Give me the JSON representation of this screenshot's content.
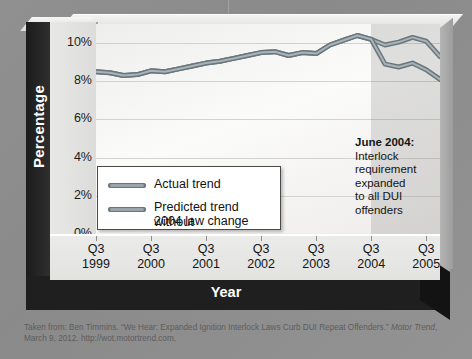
{
  "axes": {
    "y_title": "Percentage",
    "x_title": "Year",
    "y_ticks": [
      "10%",
      "8%",
      "6%",
      "4%",
      "2%",
      "0%"
    ],
    "x_ticks": [
      {
        "q": "Q3",
        "y": "1999"
      },
      {
        "q": "Q3",
        "y": "2000"
      },
      {
        "q": "Q3",
        "y": "2001"
      },
      {
        "q": "Q3",
        "y": "2002"
      },
      {
        "q": "Q3",
        "y": "2003"
      },
      {
        "q": "Q3",
        "y": "2004"
      },
      {
        "q": "Q3",
        "y": "2005"
      }
    ]
  },
  "legend": {
    "items": [
      {
        "label": "Actual trend",
        "color": "#7f8b92"
      },
      {
        "label": "Predicted trend without",
        "label2": "2004 law change",
        "color": "#7f8b92"
      }
    ]
  },
  "annotation": {
    "heading": "June 2004:",
    "line1": "Interlock",
    "line2": "requirement",
    "line3": "expanded",
    "line4": "to all DUI",
    "line5": "offenders"
  },
  "caption": {
    "line1_a": "Taken from: Ben Timmins. “We Hear: Expanded Ignition Interlock Laws Curb DUI Repeat Offenders.” ",
    "line1_italic": "Motor Trend",
    "line1_b": ",",
    "line2": "March 9, 2012. http://wot.motortrend.com."
  },
  "colors": {
    "line": "#838f95",
    "line_dark": "#6a767d",
    "plot_bg": "#f7f7f5",
    "shade": "#6e6e6e",
    "axis_bar": "#1f1f1f"
  },
  "chart_data": {
    "type": "line",
    "title": "",
    "xlabel": "Year",
    "ylabel": "Percentage",
    "ylim": [
      0,
      11
    ],
    "grid": true,
    "legend_position": "inside-lower-left",
    "x_tick_labels": [
      "Q3 1999",
      "Q3 2000",
      "Q3 2001",
      "Q3 2002",
      "Q3 2003",
      "Q3 2004",
      "Q3 2005"
    ],
    "x": [
      "Q3 1999",
      "Q4 1999",
      "Q1 2000",
      "Q2 2000",
      "Q3 2000",
      "Q4 2000",
      "Q1 2001",
      "Q2 2001",
      "Q3 2001",
      "Q4 2001",
      "Q1 2002",
      "Q2 2002",
      "Q3 2002",
      "Q4 2002",
      "Q1 2003",
      "Q2 2003",
      "Q3 2003",
      "Q4 2003",
      "Q1 2004",
      "Q2 2004",
      "Q3 2004",
      "Q4 2004",
      "Q1 2005",
      "Q2 2005",
      "Q3 2005",
      "Q4 2005"
    ],
    "series": [
      {
        "name": "Actual trend",
        "color": "#838f95",
        "values": [
          8.5,
          8.45,
          8.3,
          8.35,
          8.55,
          8.5,
          8.65,
          8.8,
          8.95,
          9.05,
          9.2,
          9.35,
          9.5,
          9.55,
          9.35,
          9.5,
          9.45,
          9.9,
          10.15,
          10.4,
          10.2,
          8.9,
          8.75,
          8.95,
          8.6,
          8.1
        ]
      },
      {
        "name": "Predicted trend without 2004 law change",
        "color": "#838f95",
        "values": [
          8.5,
          8.45,
          8.3,
          8.35,
          8.55,
          8.5,
          8.65,
          8.8,
          8.95,
          9.05,
          9.2,
          9.35,
          9.5,
          9.55,
          9.35,
          9.5,
          9.45,
          9.9,
          10.15,
          10.4,
          10.2,
          9.9,
          10.05,
          10.3,
          10.1,
          9.3
        ]
      }
    ],
    "annotations": [
      {
        "x": "Q3 2004",
        "text": "June 2004: Interlock requirement expanded to all DUI offenders",
        "shaded_region_from": "Q3 2004"
      }
    ]
  }
}
